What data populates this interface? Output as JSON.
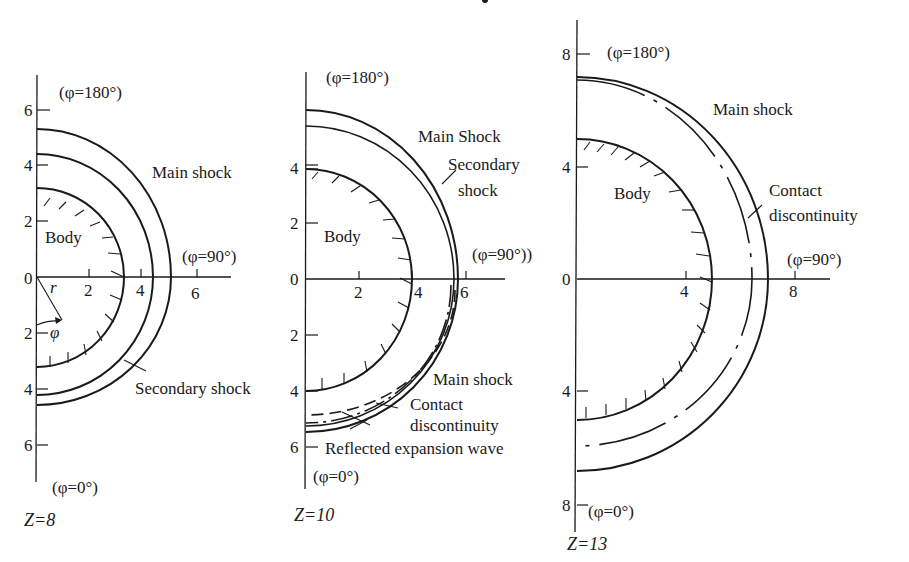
{
  "figure": {
    "panels": [
      {
        "id": "z8",
        "station_label": "Z=8",
        "phi_top": "(φ=180°)",
        "phi_right": "(φ=90°)",
        "phi_bottom": "(φ=0°)",
        "x_ticks": [
          "2",
          "4",
          "6"
        ],
        "y_ticks_upper": [
          "6",
          "4",
          "2",
          "0"
        ],
        "y_ticks_lower": [
          "2",
          "4",
          "6"
        ],
        "labels": {
          "main_shock": "Main shock",
          "body": "Body",
          "secondary_shock": "Secondary shock",
          "r": "r",
          "phi": "φ"
        },
        "radii": {
          "body": 3.3,
          "secondary_shock_top": 4.4,
          "main_shock_top": 5.3,
          "secondary_shock_bottom": 4.4,
          "main_shock_bottom": 4.7
        }
      },
      {
        "id": "z10",
        "station_label": "Z=10",
        "phi_top": "(φ=180°)",
        "phi_right": "(φ=90°))",
        "phi_bottom": "(φ=0°)",
        "x_ticks": [
          "2",
          "4",
          "6"
        ],
        "y_ticks_upper": [
          "4",
          "2",
          "0"
        ],
        "y_ticks_lower": [
          "2",
          "4",
          "6"
        ],
        "labels": {
          "main_shock_upper": "Main Shock",
          "secondary_shock_line1": "Secondary",
          "secondary_shock_line2": "shock",
          "body": "Body",
          "main_shock_lower": "Main shock",
          "contact_line1": "Contact",
          "contact_line2": "discontinuity",
          "reflected": "Reflected expansion wave"
        },
        "radii": {
          "body": 4.0,
          "secondary_shock_top": 5.5,
          "main_shock_top": 6.1,
          "main_shock_bottom": 5.5,
          "reflected_expansion_wave_bottom": 4.9
        }
      },
      {
        "id": "z13",
        "station_label": "Z=13",
        "phi_top": "(φ=180°)",
        "phi_right": "(φ=90°)",
        "phi_bottom": "(φ=0°)",
        "x_ticks": [
          "4",
          "8"
        ],
        "y_ticks_upper": [
          "8",
          "4",
          "0"
        ],
        "y_ticks_lower": [
          "4",
          "8"
        ],
        "labels": {
          "main_shock": "Main shock",
          "body": "Body",
          "contact_line1": "Contact",
          "contact_line2": "discontinuity"
        },
        "radii": {
          "body": 5.0,
          "contact_top": 7.1,
          "main_shock_top": 7.2,
          "contact_bottom": 6.0,
          "main_shock_bottom": 6.9
        }
      }
    ]
  }
}
